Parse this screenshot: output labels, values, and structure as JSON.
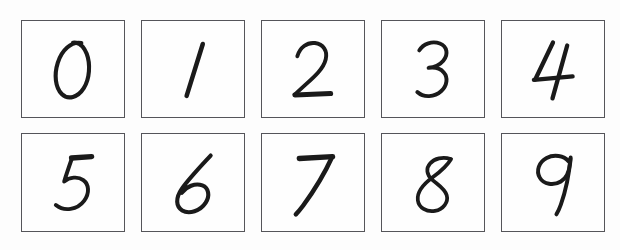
{
  "sheet": {
    "title": "Handwritten digit grid",
    "background_color": "#fdfdfd",
    "border_color": "#55555a",
    "ink_color": "#1a1a1a",
    "rows": 2,
    "columns": 5
  },
  "rows": [
    {
      "name": "top-row",
      "cells": [
        {
          "digit": "0",
          "icon": "handwritten-zero-glyph"
        },
        {
          "digit": "1",
          "icon": "handwritten-one-glyph"
        },
        {
          "digit": "2",
          "icon": "handwritten-two-glyph"
        },
        {
          "digit": "3",
          "icon": "handwritten-three-glyph"
        },
        {
          "digit": "4",
          "icon": "handwritten-four-glyph"
        }
      ]
    },
    {
      "name": "bottom-row",
      "cells": [
        {
          "digit": "5",
          "icon": "handwritten-five-glyph"
        },
        {
          "digit": "6",
          "icon": "handwritten-six-glyph"
        },
        {
          "digit": "7",
          "icon": "handwritten-seven-glyph"
        },
        {
          "digit": "8",
          "icon": "handwritten-eight-glyph"
        },
        {
          "digit": "9",
          "icon": "handwritten-nine-glyph"
        }
      ]
    }
  ]
}
